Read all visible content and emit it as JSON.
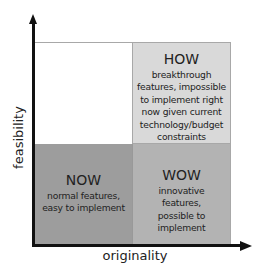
{
  "diagram": {
    "axes": {
      "x_label": "originality",
      "y_label": "feasibility"
    },
    "quadrants": {
      "top_left": {
        "title": "",
        "description": ""
      },
      "top_right": {
        "title": "HOW",
        "description": "breakthrough features, impossible to implement right now given current technology/budget constraints",
        "color": "#d9d9d9"
      },
      "bottom_left": {
        "title": "NOW",
        "description": "normal features, easy to implement",
        "color": "#9d9d9d"
      },
      "bottom_right": {
        "title": "WOW",
        "description": "innovative features, possible to implement",
        "color": "#b3b3b3"
      }
    }
  }
}
